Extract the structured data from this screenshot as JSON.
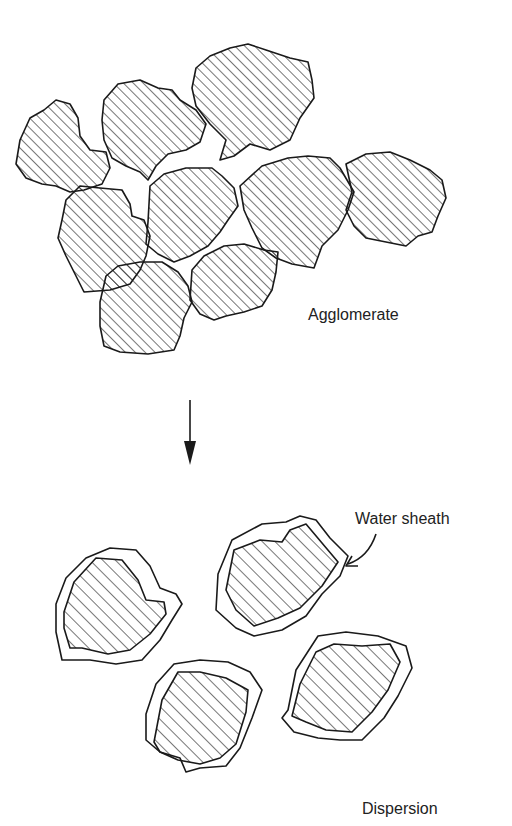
{
  "diagram": {
    "labels": {
      "agglomerate": "Agglomerate",
      "water_sheath": "Water sheath",
      "dispersion": "Dispersion"
    },
    "stages": [
      {
        "name": "Agglomerate",
        "particle_count": 10,
        "state": "clustered hatched particles touching"
      },
      {
        "name": "Dispersion",
        "particle_count": 4,
        "state": "separated hatched particles each surrounded by water sheath"
      }
    ],
    "transition": {
      "direction": "down",
      "glyph": "arrow-down"
    },
    "colors": {
      "ink": "#1a1a1a",
      "background": "#ffffff"
    }
  }
}
